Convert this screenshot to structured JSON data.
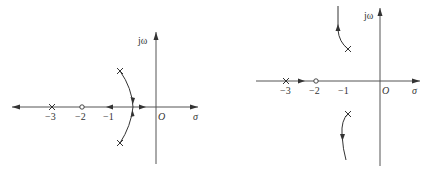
{
  "figures": [
    {
      "id": "left",
      "type": "root-locus",
      "axis_labels": {
        "real": "σ",
        "imag": "jω",
        "origin": "O"
      },
      "tick_labels": [
        "−3",
        "−2",
        "−1"
      ],
      "poles": [
        {
          "re": -3,
          "im": 0
        },
        {
          "re": -0.7,
          "im": 1
        },
        {
          "re": -0.7,
          "im": -1
        }
      ],
      "zeros": [
        {
          "re": -2,
          "im": 0
        }
      ],
      "branches": [
        "complex poles arc toward real axis breakaway near -0.5",
        "real axis segment left of -3 to -infinity",
        "real axis segment from -2 toward -1",
        "real axis segment toward 0"
      ],
      "colors": {
        "line": "#333333",
        "background": "#ffffff"
      }
    },
    {
      "id": "right",
      "type": "root-locus",
      "axis_labels": {
        "real": "σ",
        "imag": "jω",
        "origin": "O"
      },
      "tick_labels": [
        "−3",
        "−2",
        "−1"
      ],
      "poles": [
        {
          "re": -3,
          "im": 0
        },
        {
          "re": -0.8,
          "im": 1.3
        },
        {
          "re": -0.8,
          "im": -1.3
        }
      ],
      "zeros": [
        {
          "re": -2,
          "im": 0
        }
      ],
      "branches": [
        "real axis from pole -3 to zero -2",
        "upper complex pole curves up toward +j infinity",
        "lower complex pole curves down toward -j infinity"
      ],
      "colors": {
        "line": "#333333",
        "background": "#ffffff"
      }
    }
  ]
}
